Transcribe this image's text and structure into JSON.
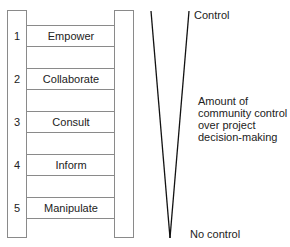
{
  "ladder": {
    "rungs": [
      {
        "number": "1",
        "label": "Empower"
      },
      {
        "number": "2",
        "label": "Collaborate"
      },
      {
        "number": "3",
        "label": "Consult"
      },
      {
        "number": "4",
        "label": "Inform"
      },
      {
        "number": "5",
        "label": "Manipulate"
      }
    ]
  },
  "scale": {
    "top_label": "Control",
    "bottom_label": "No control",
    "description_lines": [
      "Amount of",
      "community control",
      "over project",
      "decision-making"
    ]
  },
  "colors": {
    "rail_stroke": "#8a8a8a",
    "v_stroke": "#111111",
    "text": "#222222"
  }
}
